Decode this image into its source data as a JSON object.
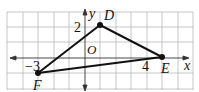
{
  "figure": {
    "type": "coordinate-plane-triangle",
    "grid": {
      "x_min": -5,
      "x_max": 7,
      "y_min": -2,
      "y_max": 3,
      "unit_px": 15.5
    },
    "axes": {
      "x_label": "x",
      "y_label": "y",
      "origin_label": "O"
    },
    "tick_labels": {
      "x_neg": "−3",
      "x_pos": "4",
      "y_pos": "2"
    },
    "points": [
      {
        "name": "D",
        "x": 1,
        "y": 2
      },
      {
        "name": "E",
        "x": 5,
        "y": 0
      },
      {
        "name": "F",
        "x": -3,
        "y": -1
      }
    ],
    "colors": {
      "grid": "#b8b8b8",
      "axis": "#333333",
      "line": "#111111",
      "point": "#111111"
    }
  }
}
